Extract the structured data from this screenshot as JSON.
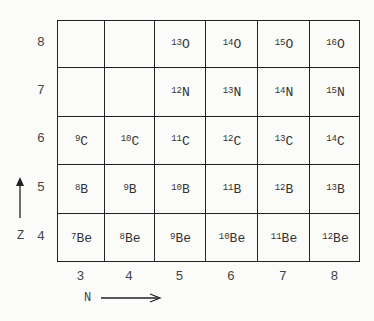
{
  "diagram": {
    "type": "chart of nuclides",
    "z_axis": {
      "label": "Z",
      "values": [
        8,
        7,
        6,
        5,
        4
      ]
    },
    "n_axis": {
      "label": "N",
      "values": [
        3,
        4,
        5,
        6,
        7,
        8
      ]
    },
    "rows": [
      {
        "z": 8,
        "element": "O",
        "cells": [
          "",
          "",
          "13",
          "14",
          "15",
          "16"
        ]
      },
      {
        "z": 7,
        "element": "N",
        "cells": [
          "",
          "",
          "12",
          "13",
          "14",
          "15"
        ]
      },
      {
        "z": 6,
        "element": "C",
        "cells": [
          "9",
          "10",
          "11",
          "12",
          "13",
          "14"
        ]
      },
      {
        "z": 5,
        "element": "B",
        "cells": [
          "8",
          "9",
          "10",
          "11",
          "12",
          "13"
        ]
      },
      {
        "z": 4,
        "element": "Be",
        "cells": [
          "7",
          "8",
          "9",
          "10",
          "11",
          "12"
        ]
      }
    ]
  }
}
